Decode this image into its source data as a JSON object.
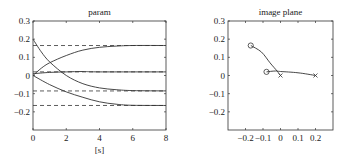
{
  "chart_data": [
    {
      "type": "line",
      "title": "param",
      "xlabel": "[s]",
      "ylabel": "",
      "xlim": [
        0,
        8
      ],
      "ylim": [
        -0.3,
        0.3
      ],
      "xticks": [
        "0",
        "2",
        "4",
        "6",
        "8"
      ],
      "yticks": [
        "0.3",
        "0.2",
        "0.1",
        "0",
        "−0.1",
        "−0.2"
      ],
      "grid": false,
      "series": [
        {
          "name": "param 1 (decaying)",
          "style": "solid",
          "x": [
            0,
            0.5,
            1,
            2,
            3,
            4,
            5,
            6,
            8
          ],
          "values": [
            0.2,
            0.13,
            0.075,
            0.0,
            -0.045,
            -0.068,
            -0.078,
            -0.083,
            -0.085
          ]
        },
        {
          "name": "param 2 (rising)",
          "style": "solid",
          "x": [
            0,
            0.5,
            1,
            2,
            3,
            4,
            5,
            6,
            8
          ],
          "values": [
            0.0,
            0.04,
            0.07,
            0.11,
            0.14,
            0.155,
            0.162,
            0.165,
            0.165
          ]
        },
        {
          "name": "param 3 (near zero)",
          "style": "solid",
          "x": [
            0,
            1,
            2,
            3,
            4,
            8
          ],
          "values": [
            0.01,
            0.017,
            0.02,
            0.022,
            0.02,
            0.02
          ]
        },
        {
          "name": "param 4 (falling)",
          "style": "solid",
          "x": [
            0,
            1,
            2,
            3,
            4,
            5,
            6,
            8
          ],
          "values": [
            0.0,
            -0.05,
            -0.09,
            -0.12,
            -0.145,
            -0.158,
            -0.164,
            -0.165
          ]
        },
        {
          "name": "target 1",
          "style": "dashed",
          "x": [
            0,
            8
          ],
          "values": [
            0.165,
            0.165
          ]
        },
        {
          "name": "target 2",
          "style": "dashed",
          "x": [
            0,
            8
          ],
          "values": [
            0.02,
            0.02
          ]
        },
        {
          "name": "target 3",
          "style": "dashed",
          "x": [
            0,
            8
          ],
          "values": [
            -0.085,
            -0.085
          ]
        },
        {
          "name": "target 4",
          "style": "dashed",
          "x": [
            0,
            8
          ],
          "values": [
            -0.165,
            -0.165
          ]
        }
      ]
    },
    {
      "type": "scatter",
      "title": "image plane",
      "xlabel": "",
      "ylabel": "",
      "xlim": [
        -0.3,
        0.3
      ],
      "ylim": [
        -0.3,
        0.3
      ],
      "xticks": [
        "−0.2",
        "−0.1",
        "0",
        "0.1",
        "0.2"
      ],
      "yticks": [
        "0.3",
        "0.2",
        "0.1",
        "0",
        "−0.1",
        "−0.2"
      ],
      "grid": false,
      "series": [
        {
          "name": "trajectory 1",
          "start_marker": "circle",
          "end_marker": "x",
          "x": [
            -0.17,
            -0.11,
            -0.06,
            -0.02,
            0.0
          ],
          "y": [
            0.165,
            0.13,
            0.07,
            0.025,
            0.0
          ]
        },
        {
          "name": "trajectory 2",
          "start_marker": "circle",
          "end_marker": "x",
          "x": [
            -0.08,
            -0.03,
            0.0,
            0.1,
            0.2
          ],
          "y": [
            0.02,
            0.025,
            0.022,
            0.015,
            0.0
          ]
        }
      ]
    }
  ]
}
